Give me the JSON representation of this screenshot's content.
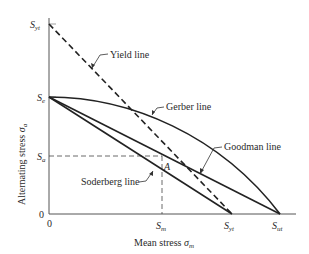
{
  "diagram": {
    "type": "fatigue-failure-diagram",
    "axes": {
      "x_label": "Mean stress",
      "x_symbol": "σ",
      "x_symbol_sub": "m",
      "y_label": "Alternating stress",
      "y_symbol": "σ",
      "y_symbol_sub": "a",
      "x_origin_label": "0",
      "y_origin_label": "0"
    },
    "y_ticks": [
      {
        "main": "S",
        "sub": "yt"
      },
      {
        "main": "S",
        "sub": "e"
      },
      {
        "main": "S",
        "sub": "a"
      }
    ],
    "x_ticks": [
      {
        "main": "S",
        "sub": "m"
      },
      {
        "main": "S",
        "sub": "yt"
      },
      {
        "main": "S",
        "sub": "ut"
      }
    ],
    "lines": [
      {
        "name": "Yield line",
        "style": "dashed",
        "from": "Syt (y-axis)",
        "to": "Syt (x-axis)"
      },
      {
        "name": "Gerber line",
        "style": "solid-curve",
        "from": "Se",
        "to": "Sut"
      },
      {
        "name": "Goodman line",
        "style": "solid",
        "from": "Se",
        "to": "Sut"
      },
      {
        "name": "Soderberg line",
        "style": "solid",
        "from": "Se",
        "to": "Syt"
      }
    ],
    "point": {
      "label": "A"
    },
    "colors": {
      "ink": "#222222",
      "axis": "#555555"
    }
  }
}
